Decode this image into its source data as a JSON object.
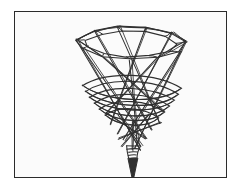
{
  "figure": {
    "title": "Conical wireframe spinning-top sketch",
    "medium": "line drawing",
    "frame_color": "#2b2b2b",
    "background_color": "#fbfbfb",
    "page_background": "#ffffff",
    "ink_color": "#303030",
    "frame": {
      "x": 14,
      "y": 11,
      "width": 213,
      "height": 167
    },
    "subject_name": "funnel-cone-wireframe",
    "parts": [
      {
        "name": "top-rim",
        "description": "angular elliptical opening at the top of the cone"
      },
      {
        "name": "cone-body",
        "description": "tapering conical body drawn with crossing straight struts"
      },
      {
        "name": "coil-bands",
        "description": "dense spiral coil wraps around the lower cone"
      },
      {
        "name": "collar",
        "description": "small banded collar just above the tip"
      },
      {
        "name": "needle-tip",
        "description": "sharp needle point at the bottom"
      }
    ]
  },
  "chart_data": {
    "type": "scatter",
    "title": "Conical wireframe spinning-top sketch",
    "xlabel": "",
    "ylabel": "",
    "grid": false,
    "legend": null,
    "xlim": [
      0,
      213
    ],
    "ylim": [
      0,
      167
    ],
    "rim_points": [
      [
        62,
        28
      ],
      [
        80,
        19
      ],
      [
        104,
        15
      ],
      [
        132,
        16
      ],
      [
        158,
        21
      ],
      [
        172,
        30
      ],
      [
        166,
        40
      ],
      [
        144,
        46
      ],
      [
        116,
        48
      ],
      [
        88,
        45
      ],
      [
        68,
        37
      ]
    ],
    "rim_inner_points": [
      [
        70,
        29
      ],
      [
        88,
        22
      ],
      [
        108,
        19
      ],
      [
        131,
        20
      ],
      [
        152,
        25
      ],
      [
        163,
        32
      ],
      [
        156,
        40
      ],
      [
        136,
        44
      ],
      [
        112,
        45
      ],
      [
        90,
        42
      ],
      [
        74,
        35
      ]
    ],
    "cone_struts": [
      [
        [
          62,
          28
        ],
        [
          126,
          140
        ]
      ],
      [
        [
          172,
          30
        ],
        [
          120,
          138
        ]
      ],
      [
        [
          80,
          19
        ],
        [
          138,
          120
        ]
      ],
      [
        [
          158,
          21
        ],
        [
          104,
          124
        ]
      ],
      [
        [
          104,
          15
        ],
        [
          146,
          112
        ]
      ],
      [
        [
          132,
          16
        ],
        [
          96,
          114
        ]
      ],
      [
        [
          68,
          37
        ],
        [
          132,
          128
        ]
      ],
      [
        [
          166,
          40
        ],
        [
          110,
          130
        ]
      ],
      [
        [
          88,
          45
        ],
        [
          150,
          100
        ]
      ],
      [
        [
          144,
          46
        ],
        [
          92,
          102
        ]
      ],
      [
        [
          116,
          48
        ],
        [
          124,
          136
        ]
      ],
      [
        [
          62,
          28
        ],
        [
          88,
          45
        ]
      ],
      [
        [
          172,
          30
        ],
        [
          144,
          46
        ]
      ],
      [
        [
          80,
          19
        ],
        [
          62,
          28
        ]
      ],
      [
        [
          158,
          21
        ],
        [
          172,
          30
        ]
      ],
      [
        [
          104,
          15
        ],
        [
          80,
          19
        ]
      ],
      [
        [
          132,
          16
        ],
        [
          158,
          21
        ]
      ],
      [
        [
          104,
          15
        ],
        [
          132,
          16
        ]
      ]
    ],
    "coil_bands": [
      {
        "cy": 74,
        "rx": 50,
        "ry": 9
      },
      {
        "cy": 80,
        "rx": 47,
        "ry": 9
      },
      {
        "cy": 86,
        "rx": 43,
        "ry": 8
      },
      {
        "cy": 92,
        "rx": 38,
        "ry": 8
      },
      {
        "cy": 98,
        "rx": 33,
        "ry": 7
      },
      {
        "cy": 104,
        "rx": 27,
        "ry": 6
      }
    ],
    "coil_center_x": 118,
    "lower_struts": [
      [
        [
          92,
          102
        ],
        [
          132,
          128
        ]
      ],
      [
        [
          146,
          112
        ],
        [
          104,
          128
        ]
      ],
      [
        [
          104,
          104
        ],
        [
          128,
          136
        ]
      ],
      [
        [
          134,
          104
        ],
        [
          108,
          136
        ]
      ],
      [
        [
          118,
          110
        ],
        [
          118,
          140
        ]
      ]
    ],
    "collar": {
      "x": 112,
      "y": 136,
      "width": 14,
      "height": 12,
      "bands": 4
    },
    "tip": {
      "apex": [
        119,
        172
      ],
      "base_left": [
        114,
        148
      ],
      "base_right": [
        124,
        148
      ]
    }
  }
}
